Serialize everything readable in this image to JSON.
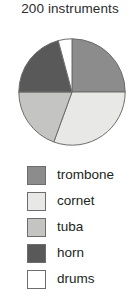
{
  "chart_data": {
    "type": "pie",
    "title": "200 instruments",
    "total": 200,
    "total_label": "200",
    "unit_label": "instruments",
    "categories": [
      "trombone",
      "cornet",
      "tuba",
      "horn",
      "drums"
    ],
    "values": [
      50,
      60,
      40,
      40,
      10
    ],
    "percentages": [
      25,
      30,
      20,
      20,
      5
    ],
    "start_angle_deg": 0,
    "direction": "clockwise",
    "slice_colors": [
      "#8c8c8c",
      "#e8e8e6",
      "#c4c4c2",
      "#595959",
      "#ffffff"
    ],
    "slice_start_angles_deg": [
      0,
      90,
      200,
      270,
      345
    ],
    "slice_end_angles_deg": [
      90,
      200,
      270,
      345,
      360
    ],
    "stroke_color": "#6d6d6d",
    "legend_position": "bottom",
    "grid": false,
    "xlabel": "",
    "ylabel": ""
  },
  "legend": {
    "items": [
      {
        "label": "trombone",
        "color": "#8c8c8c"
      },
      {
        "label": "cornet",
        "color": "#e8e8e6"
      },
      {
        "label": "tuba",
        "color": "#c4c4c2"
      },
      {
        "label": "horn",
        "color": "#595959"
      },
      {
        "label": "drums",
        "color": "#ffffff"
      }
    ]
  }
}
